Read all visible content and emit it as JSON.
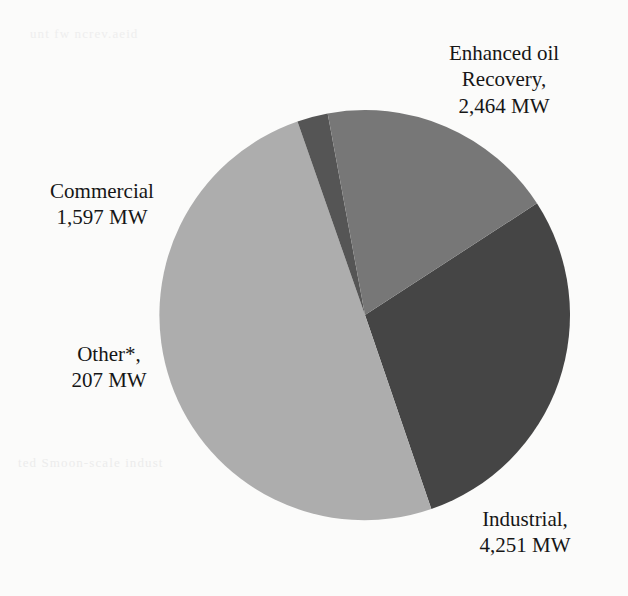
{
  "figure": {
    "background_color": "#fbfbfa",
    "text_color": "#161616"
  },
  "bleedthrough": {
    "line_left": "ted Smoon-scale indust",
    "line_right": "ee wahinsonwrrve",
    "line_top": "unt fw ncrev.aeid"
  },
  "chart_data": {
    "type": "pie",
    "title": "",
    "unit": "MW",
    "total": 8519,
    "legend": "none",
    "labels_position": "outside",
    "start_angle_deg": -33,
    "direction": "clockwise",
    "center": {
      "x": 365,
      "y": 315
    },
    "radius": 205,
    "categories": [
      "Enhanced oil Recovery",
      "Industrial",
      "Commercial",
      "Other*"
    ],
    "values": [
      2464,
      4251,
      1597,
      207
    ],
    "colors": [
      "#454545",
      "#adadad",
      "#777777",
      "#555555"
    ],
    "slices": [
      {
        "name": "Enhanced oil Recovery",
        "value": 2464,
        "value_text": "2,464 MW",
        "color": "#454545",
        "percent": 28.9,
        "angle_deg": 104.1,
        "label_line1": "Enhanced oil",
        "label_line2": "Recovery,",
        "label_line3": "2,464 MW"
      },
      {
        "name": "Industrial",
        "value": 4251,
        "value_text": "4,251 MW",
        "color": "#adadad",
        "percent": 49.9,
        "angle_deg": 179.7,
        "label_line1": "Industrial,",
        "label_line2": "4,251 MW"
      },
      {
        "name": "Other*",
        "value": 207,
        "value_text": "207 MW",
        "color": "#555555",
        "percent": 2.4,
        "angle_deg": 8.7,
        "label_line1": "Other*,",
        "label_line2": "207 MW"
      },
      {
        "name": "Commercial",
        "value": 1597,
        "value_text": "1,597 MW",
        "color": "#777777",
        "percent": 18.7,
        "angle_deg": 67.5,
        "label_line1": "Commercial",
        "label_line2": "1,597 MW"
      }
    ]
  },
  "labels": {
    "enhanced_oil_recovery": "Enhanced oil\nRecovery,\n2,464 MW",
    "commercial": "Commercial\n1,597 MW",
    "other": "Other*,\n207 MW",
    "industrial": "Industrial,\n4,251 MW"
  }
}
